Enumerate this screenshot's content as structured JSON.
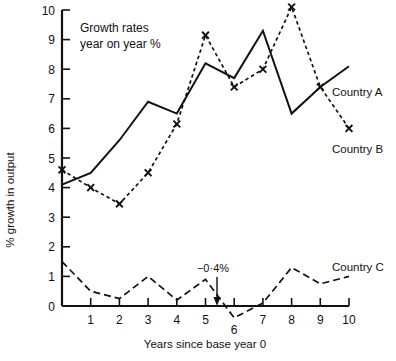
{
  "chart_data": {
    "type": "line",
    "title": "Growth rates year on year %",
    "title_lines": [
      "Growth rates",
      "year on year %"
    ],
    "xlabel": "Years since base year 0",
    "ylabel": "% growth in output",
    "x": [
      0,
      1,
      2,
      3,
      4,
      5,
      6,
      7,
      8,
      9,
      10
    ],
    "xticklabels": [
      "0",
      "1",
      "2",
      "3",
      "4",
      "5",
      "6",
      "7",
      "8",
      "9",
      "10"
    ],
    "yticklabels": [
      "0",
      "1",
      "2",
      "3",
      "4",
      "5",
      "6",
      "7",
      "8",
      "9",
      "10"
    ],
    "xlim": [
      0,
      10
    ],
    "ylim": [
      -0.6,
      10
    ],
    "grid": false,
    "legend_position": "right-of-line-ends",
    "series": [
      {
        "name": "Country A",
        "style": "solid",
        "marker": "none",
        "color": "#111111",
        "values": [
          4.1,
          4.5,
          5.6,
          6.9,
          6.5,
          8.2,
          7.7,
          9.3,
          6.5,
          7.4,
          8.1
        ]
      },
      {
        "name": "Country B",
        "style": "dotted",
        "marker": "x",
        "color": "#111111",
        "values": [
          4.6,
          4.0,
          3.45,
          4.5,
          6.15,
          9.15,
          7.4,
          8.0,
          10.1,
          7.4,
          6.0
        ]
      },
      {
        "name": "Country C",
        "style": "dashed",
        "marker": "none",
        "color": "#111111",
        "values": [
          1.5,
          0.5,
          0.25,
          1.0,
          0.2,
          0.9,
          -0.4,
          0.1,
          1.3,
          0.75,
          1.0
        ]
      }
    ],
    "annotations": [
      {
        "text": "−0·4%",
        "series": "Country C",
        "x": 6,
        "y": -0.4,
        "arrow": true
      }
    ]
  }
}
